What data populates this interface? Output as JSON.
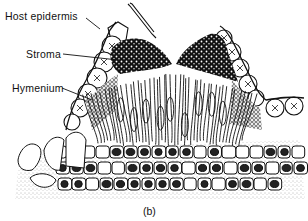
{
  "figure": {
    "caption": "(b)",
    "labels": [
      {
        "id": "host-epidermis",
        "text": "Host epidermis"
      },
      {
        "id": "stroma",
        "text": "Stroma"
      },
      {
        "id": "hymenium",
        "text": "Hymenium"
      }
    ],
    "colors": {
      "ink": "#111111",
      "background": "#ffffff",
      "stipple": "#777777"
    }
  }
}
